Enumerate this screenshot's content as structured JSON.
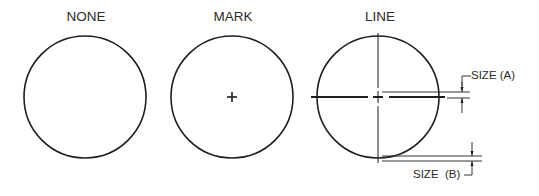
{
  "diagram": {
    "panels": [
      {
        "id": "none",
        "title": "NONE",
        "center_mark": "none"
      },
      {
        "id": "mark",
        "title": "MARK",
        "center_mark": "cross"
      },
      {
        "id": "line",
        "title": "LINE",
        "center_mark": "centerlines"
      }
    ],
    "dimensions": {
      "size_a": "SIZE (A)",
      "size_b": "SIZE  (B)"
    },
    "colors": {
      "stroke": "#1e1e1e",
      "text": "#2a2a2a",
      "background": "#ffffff"
    }
  }
}
